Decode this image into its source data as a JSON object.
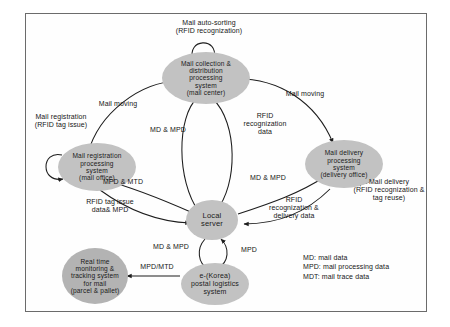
{
  "diagram": {
    "frame": {
      "border_color": "#6b6b6b"
    },
    "node_fill_light": "#c2c2c2",
    "node_fill_dark": "#b3b3b3",
    "nodes": [
      {
        "id": "mail-center",
        "label": "Mail collection &\ndistribution\nprocessing\nsystem\n(mail center)",
        "lines": [
          "Mail collection &",
          "distribution",
          "processing",
          "system",
          "(mail center)"
        ]
      },
      {
        "id": "mail-office",
        "label": "Mail registration\nprocessing\nsystem\n(mail office)",
        "lines": [
          "Mail registration",
          "processing",
          "system",
          "(mail office)"
        ]
      },
      {
        "id": "delivery-office",
        "label": "Mail delivery\nprocessing\nsystem\n(delivery office)",
        "lines": [
          "Mail delivery",
          "processing",
          "system",
          "(delivery office)"
        ]
      },
      {
        "id": "local-server",
        "label": "Local\nserver",
        "lines": [
          "Local",
          "server"
        ]
      },
      {
        "id": "postal-logistics",
        "label": "e-(Korea)\npostal logistics\nsystem",
        "lines": [
          "e-(Korea)",
          "postal logistics",
          "system"
        ]
      },
      {
        "id": "tracking-system",
        "label": "Real time\nmonitoring &\ntracking system\nfor mail\n(parcel & pallet)",
        "lines": [
          "Real time",
          "monitoring &",
          "tracking system",
          "for mail",
          "(parcel & pallet)"
        ]
      }
    ],
    "edge_labels": [
      {
        "id": "mail-auto-sorting",
        "text": "Mail auto-sorting\n(RFID recognization)"
      },
      {
        "id": "mail-registration",
        "text": "Mail registration\n(RFID tag issue)"
      },
      {
        "id": "mail-delivery",
        "text": "Mail delivery\n(RFID recognization &\ntag reuse)"
      },
      {
        "id": "mail-moving-left",
        "text": "Mail moving"
      },
      {
        "id": "mail-moving-right",
        "text": "Mail moving"
      },
      {
        "id": "md-mpd-center",
        "text": "MD & MPD"
      },
      {
        "id": "rfid-recognization-data",
        "text": "RFID\nrecognization\ndata"
      },
      {
        "id": "md-mpd-right",
        "text": "MD & MPD"
      },
      {
        "id": "mpd-mtd-left",
        "text": "MPD & MTD"
      },
      {
        "id": "rfid-tag-issue-data",
        "text": "RFID tag issue\ndata& MPD"
      },
      {
        "id": "rfid-recognization-delivery-data",
        "text": "RFID\nrecognization &\ndelivery data"
      },
      {
        "id": "md-mpd-bottom",
        "text": "MD & MPD"
      },
      {
        "id": "mpd-bottom",
        "text": "MPD"
      },
      {
        "id": "mpd-mtd-bottom",
        "text": "MPD/MTD"
      }
    ],
    "legend": {
      "lines": [
        "MD: mail data",
        "MPD: mail processing data",
        "MDT: mail trace data"
      ]
    }
  }
}
